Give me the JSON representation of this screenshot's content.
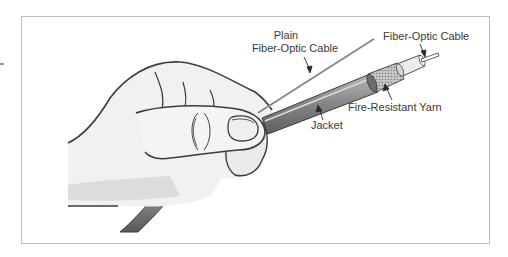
{
  "figure": {
    "labels": {
      "plain_fiber_line1": "Plain",
      "plain_fiber_line2": "Fiber-Optic Cable",
      "fiber_optic_cable": "Fiber-Optic Cable",
      "fire_resistant_yarn": "Fire-Resistant Yarn",
      "jacket": "Jacket"
    },
    "colors": {
      "frame_border": "#bdbdbd",
      "outline": "#3c3c3c",
      "hand_fill": "#f1f1f1",
      "hand_shadow": "#dcdcdc",
      "jacket_fill": "#8e8e8e",
      "yarn_fill": "#bfbfbf",
      "buffer_fill": "#e9e9e9",
      "label_text": "#3a3a3a"
    }
  }
}
